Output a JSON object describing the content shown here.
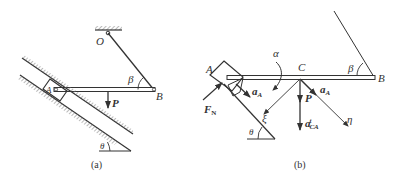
{
  "figure_a": {
    "caption": "(a)",
    "labels": {
      "O": "O",
      "A": "A",
      "B": "B",
      "P": "P",
      "beta": "β",
      "theta": "θ"
    }
  },
  "figure_b": {
    "caption": "(b)",
    "labels": {
      "A": "A",
      "B": "B",
      "C": "C",
      "alpha": "α",
      "beta": "β",
      "theta": "θ",
      "FN": "F",
      "FN_sub": "N",
      "aA_1": "a",
      "aA_1_sub": "A",
      "aA_2": "a",
      "aA_2_sub": "A",
      "P": "P",
      "aCA": "a",
      "aCA_sup": "t",
      "aCA_sub": "CA",
      "xi": "ξ",
      "eta": "η"
    }
  },
  "colors": {
    "line": "#333333",
    "hatch": "#777777"
  }
}
